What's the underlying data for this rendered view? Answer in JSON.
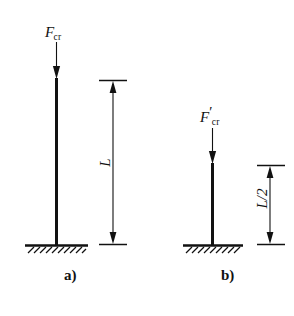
{
  "diagram": {
    "background_color": "#ffffff",
    "stroke_color": "#111111",
    "figures": [
      {
        "caption": "a)",
        "force_symbol": "F",
        "force_subscript": "cr",
        "force_prime": "",
        "dimension_label": "L",
        "column_height_px": 167,
        "support_type": "fixed-base-hatched-ground"
      },
      {
        "caption": "b)",
        "force_symbol": "F",
        "force_subscript": "cr",
        "force_prime": "′",
        "dimension_label": "L/2",
        "column_height_px": 82,
        "support_type": "fixed-base-hatched-ground"
      }
    ]
  }
}
